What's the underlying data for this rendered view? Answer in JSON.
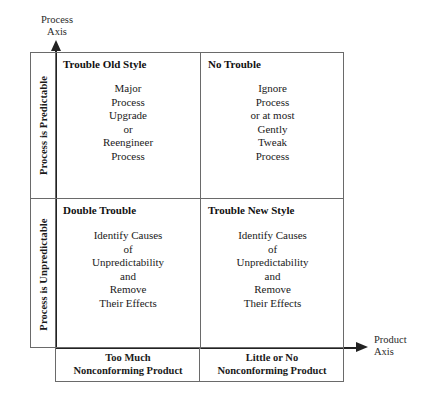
{
  "diagram": {
    "axes": {
      "vertical": {
        "label": "Process\nAxis",
        "arrow": "up-arrow-icon"
      },
      "horizontal": {
        "label": "Product\nAxis",
        "arrow": "right-arrow-icon"
      }
    },
    "row_labels": [
      {
        "id": "predictable",
        "text": "Process is Predictable"
      },
      {
        "id": "unpredictable",
        "text": "Process is Unpredictable"
      }
    ],
    "quadrants": [
      {
        "id": "top-left",
        "title": "Trouble Old Style",
        "body": "Major\nProcess\nUpgrade\nor\nReengineer\nProcess"
      },
      {
        "id": "top-right",
        "title": "No Trouble",
        "body": "Ignore\nProcess\nor at most\nGently\nTweak\nProcess"
      },
      {
        "id": "bottom-left",
        "title": "Double Trouble",
        "body": "Identify Causes\nof\nUnpredictability\nand\nRemove\nTheir Effects"
      },
      {
        "id": "bottom-right",
        "title": "Trouble New Style",
        "body": "Identify Causes\nof\nUnpredictability\nand\nRemove\nTheir Effects"
      }
    ],
    "column_footers": [
      {
        "id": "left",
        "text": "Too Much\nNonconforming Product"
      },
      {
        "id": "right",
        "text": "Little or No\nNonconforming Product"
      }
    ],
    "colors": {
      "background": "#ffffff",
      "border": "#6a6a6a",
      "axis": "#222222",
      "text": "#1a1a1a"
    }
  }
}
